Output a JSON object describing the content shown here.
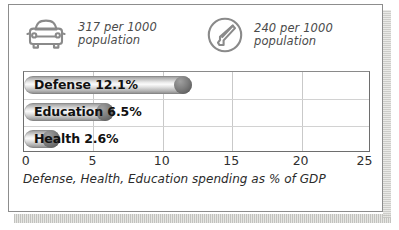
{
  "panel": {
    "border_color": "#8d8d8d",
    "background": "#ffffff"
  },
  "stats": [
    {
      "icon": "car-icon",
      "value": "317 per 1000",
      "unit": "population",
      "text": "317 per 1000\npopulation"
    },
    {
      "icon": "telephone-circle-icon",
      "value": "240 per 1000",
      "unit": "population",
      "text": "240 per 1000\npopulation"
    }
  ],
  "chart_data": {
    "type": "bar",
    "orientation": "horizontal",
    "title": "",
    "subtitle": "",
    "caption": "Defense, Health, Education spending as % of GDP",
    "xlabel": "",
    "ylabel": "",
    "categories": [
      "Defense",
      "Education",
      "Health"
    ],
    "values": [
      12.1,
      6.5,
      2.6
    ],
    "value_labels": [
      "12.1%",
      "6.5%",
      "2.6%"
    ],
    "bar_labels": [
      "Defense 12.1%",
      "Education 6.5%",
      "Health 2.6%"
    ],
    "xlim": [
      0,
      25
    ],
    "xticks": [
      0,
      5,
      10,
      15,
      20,
      25
    ],
    "xtick_labels": [
      "0",
      "5",
      "10",
      "15",
      "20",
      "25"
    ],
    "grid": true,
    "legend": null,
    "bar_color": "#c8c8c8",
    "bar_cap_color": "#6b6b6b"
  }
}
